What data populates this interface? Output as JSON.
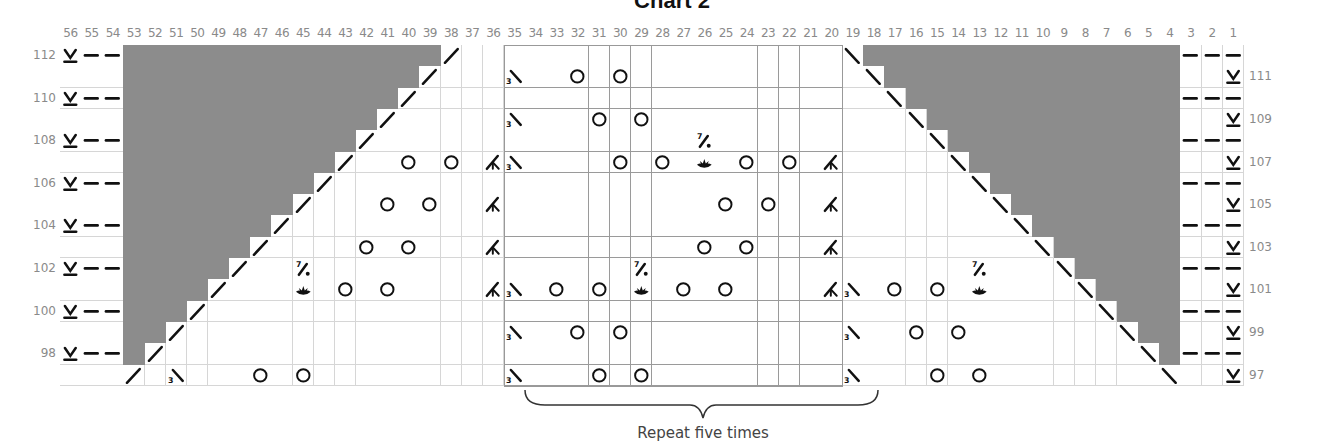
{
  "title": "Chart 2",
  "repeat_label": "Repeat five times",
  "colors": {
    "shade": "#8c8c8c",
    "grid": "#d6d6d6",
    "ink": "#111111",
    "label": "#8a8a8a"
  },
  "grid": {
    "columns_left_to_right": [
      56,
      55,
      54,
      53,
      52,
      51,
      50,
      49,
      48,
      47,
      46,
      45,
      44,
      43,
      42,
      41,
      40,
      39,
      38,
      37,
      36,
      35,
      34,
      33,
      32,
      31,
      30,
      29,
      28,
      27,
      26,
      25,
      24,
      23,
      22,
      21,
      20,
      19,
      18,
      17,
      16,
      15,
      14,
      13,
      12,
      11,
      10,
      9,
      8,
      7,
      6,
      5,
      4,
      3,
      2,
      1
    ],
    "rows_top_to_bottom": [
      112,
      111,
      110,
      109,
      108,
      107,
      106,
      105,
      104,
      103,
      102,
      101,
      100,
      99,
      98,
      97
    ],
    "left_row_labels": [
      112,
      110,
      108,
      106,
      104,
      102,
      100,
      98
    ],
    "right_row_labels": [
      111,
      109,
      107,
      105,
      103,
      101,
      99,
      97
    ],
    "repeat_columns": [
      35,
      20
    ],
    "repeat_times": "five"
  },
  "legend_symbols": {
    "V": "slip-stitch-underlined",
    "-": "purl-dash",
    "/": "right-slant-decrease",
    "\\": "left-slant-decrease",
    "3\\": "three-stitch-left-decrease",
    "O": "yarn-over",
    "A": "three-way-increase",
    "7/.": "seven-stitch-bobble-top",
    "L": "nupp-lotus",
    "X": "no-stitch-gray"
  },
  "cells": {
    "112": {
      "56": "V",
      "55": "-",
      "54": "-",
      "38": "/",
      "19": "\\",
      "3": "-",
      "2": "-",
      "1": "-"
    },
    "111": {
      "39": "/",
      "35": "3\\",
      "32": "O",
      "30": "O",
      "18": "\\",
      "1": "V"
    },
    "110": {
      "56": "V",
      "55": "-",
      "54": "-",
      "40": "/",
      "17": "\\",
      "3": "-",
      "2": "-",
      "1": "-"
    },
    "109": {
      "41": "/",
      "35": "3\\",
      "31": "O",
      "29": "O",
      "16": "\\",
      "1": "V"
    },
    "108": {
      "56": "V",
      "55": "-",
      "54": "-",
      "42": "/",
      "26": "7/.",
      "15": "\\",
      "3": "-",
      "2": "-",
      "1": "-"
    },
    "107": {
      "43": "/",
      "40": "O",
      "38": "O",
      "36": "A",
      "35": "3\\",
      "30": "O",
      "28": "O",
      "26": "L",
      "24": "O",
      "22": "O",
      "20": "A",
      "14": "\\",
      "1": "V"
    },
    "106": {
      "56": "V",
      "55": "-",
      "54": "-",
      "44": "/",
      "13": "\\",
      "3": "-",
      "2": "-",
      "1": "-"
    },
    "105": {
      "45": "/",
      "41": "O",
      "39": "O",
      "36": "A",
      "25": "O",
      "23": "O",
      "20": "A",
      "12": "\\",
      "1": "V"
    },
    "104": {
      "56": "V",
      "55": "-",
      "54": "-",
      "46": "/",
      "11": "\\",
      "3": "-",
      "2": "-",
      "1": "-"
    },
    "103": {
      "47": "/",
      "42": "O",
      "40": "O",
      "36": "A",
      "26": "O",
      "24": "O",
      "20": "A",
      "10": "\\",
      "1": "V"
    },
    "102": {
      "56": "V",
      "55": "-",
      "54": "-",
      "48": "/",
      "45": "7/.",
      "29": "7/.",
      "13": "7/.",
      "9": "\\",
      "3": "-",
      "2": "-",
      "1": "-"
    },
    "101": {
      "49": "/",
      "45": "L",
      "43": "O",
      "41": "O",
      "36": "A",
      "35": "3\\",
      "33": "O",
      "31": "O",
      "29": "L",
      "27": "O",
      "25": "O",
      "20": "A",
      "19": "3\\",
      "17": "O",
      "15": "O",
      "13": "L",
      "8": "\\",
      "1": "V"
    },
    "100": {
      "56": "V",
      "55": "-",
      "54": "-",
      "50": "/",
      "7": "\\",
      "3": "-",
      "2": "-",
      "1": "-"
    },
    "99": {
      "51": "/",
      "35": "3\\",
      "32": "O",
      "30": "O",
      "19": "3\\",
      "16": "O",
      "14": "O",
      "6": "\\",
      "1": "V"
    },
    "98": {
      "56": "V",
      "55": "-",
      "54": "-",
      "52": "/",
      "5": "\\",
      "3": "-",
      "2": "-",
      "1": "-"
    },
    "97": {
      "53": "/",
      "51": "3\\",
      "47": "O",
      "45": "O",
      "35": "3\\",
      "31": "O",
      "29": "O",
      "19": "3\\",
      "15": "O",
      "13": "O",
      "4": "\\",
      "1": "V"
    }
  },
  "shading": {
    "left_gray_description": "gray from column 53 to the column just right of the '/' in each row",
    "right_gray_description": "gray from the column just left of the '\\' down to column 4 in each row"
  }
}
